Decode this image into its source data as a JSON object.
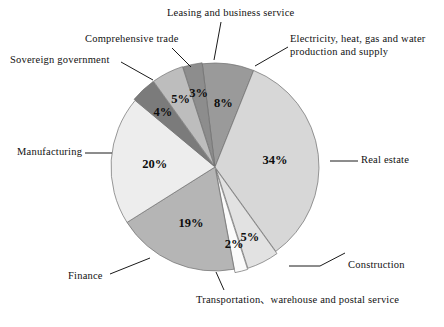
{
  "chart_data": {
    "type": "pie",
    "title": "",
    "subtitle": "",
    "xlabel": "",
    "ylabel": "",
    "legend_position": "none",
    "grid": false,
    "units": "percent",
    "total": 100,
    "categories": [
      "Electricity, heat, gas and water production and supply",
      "Real estate",
      "Construction",
      "Transportation、warehouse and postal service",
      "Finance",
      "Manufacturing",
      "Sovereign government",
      "Comprehensive trade",
      "Leasing and business service"
    ],
    "values": [
      8,
      34,
      5,
      2,
      19,
      20,
      4,
      5,
      3
    ],
    "data_labels": [
      "8%",
      "34%",
      "5%",
      "2%",
      "19%",
      "20%",
      "4%",
      "5%",
      "3%"
    ],
    "colors": [
      "#9a9a9a",
      "#d7d7d7",
      "#e2e2e2",
      "#fbfbfb",
      "#b5b5b5",
      "#ededed",
      "#7b7b7b",
      "#bdbdbd",
      "#8d8d8d"
    ],
    "slices": [
      {
        "label": "Electricity, heat, gas and water production and supply",
        "label_line1": "Electricity, heat, gas and water",
        "label_line2": "production and supply",
        "value": 8,
        "data_label": "8%",
        "color": "#9a9a9a"
      },
      {
        "label": "Real estate",
        "label_line1": "Real estate",
        "label_line2": "",
        "value": 34,
        "data_label": "34%",
        "color": "#d7d7d7"
      },
      {
        "label": "Construction",
        "label_line1": "Construction",
        "label_line2": "",
        "value": 5,
        "data_label": "5%",
        "color": "#e2e2e2"
      },
      {
        "label": "Transportation、warehouse and postal service",
        "label_line1": "Transportation、warehouse and postal service",
        "label_line2": "",
        "value": 2,
        "data_label": "2%",
        "color": "#fbfbfb"
      },
      {
        "label": "Finance",
        "label_line1": "Finance",
        "label_line2": "",
        "value": 19,
        "data_label": "19%",
        "color": "#b5b5b5"
      },
      {
        "label": "Manufacturing",
        "label_line1": "Manufacturing",
        "label_line2": "",
        "value": 20,
        "data_label": "20%",
        "color": "#ededed"
      },
      {
        "label": "Sovereign government",
        "label_line1": "Sovereign government",
        "label_line2": "",
        "value": 4,
        "data_label": "4%",
        "color": "#7b7b7b"
      },
      {
        "label": "Comprehensive trade",
        "label_line1": "Comprehensive trade",
        "label_line2": "",
        "value": 5,
        "data_label": "5%",
        "color": "#bdbdbd"
      },
      {
        "label": "Leasing and business service",
        "label_line1": "Leasing and business service",
        "label_line2": "",
        "value": 3,
        "data_label": "3%",
        "color": "#8d8d8d"
      }
    ]
  },
  "figure": {
    "background_color": "#ffffff",
    "outline_color": "#6e6e6e",
    "leader_color": "#1a1a1a"
  }
}
